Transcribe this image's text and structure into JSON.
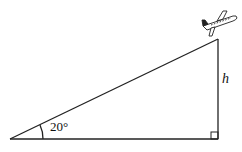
{
  "diagram": {
    "type": "right-triangle",
    "angle_label": "20°",
    "height_label": "h",
    "object_icon": "airplane-icon",
    "colors": {
      "stroke": "#222222",
      "background": "#ffffff"
    }
  }
}
